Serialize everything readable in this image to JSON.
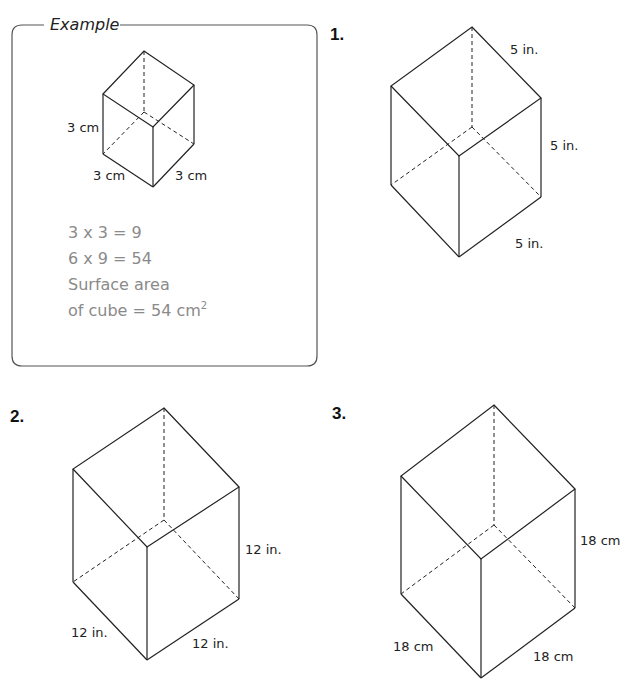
{
  "example": {
    "title": "Example",
    "labels": {
      "height": "3 cm",
      "left": "3 cm",
      "right": "3 cm"
    },
    "work": [
      "3 x 3 = 9",
      "6 x 9 = 54",
      "Surface area",
      "of cube = 54 cm"
    ],
    "superscript": "2"
  },
  "problems": [
    {
      "number": "1.",
      "labels": {
        "top": "5 in.",
        "height": "5 in.",
        "bottom": "5 in."
      }
    },
    {
      "number": "2.",
      "labels": {
        "height": "12 in.",
        "left": "12 in.",
        "right": "12 in."
      }
    },
    {
      "number": "3.",
      "labels": {
        "height": "18 cm",
        "left": "18 cm",
        "right": "18 cm"
      }
    }
  ],
  "colors": {
    "line": "#222222",
    "work_text": "#8a8a8a"
  }
}
